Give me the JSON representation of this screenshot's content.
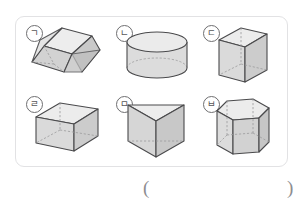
{
  "worksheet": {
    "answer_blank": {
      "open_paren": "(",
      "close_paren": ")"
    },
    "border_color": "#e2e2e4",
    "solid_fill_color": "#d9d9d9",
    "solid_stroke_color": "#4a4a4c",
    "hidden_edge_color": "#9a9a9c"
  },
  "solids": [
    {
      "label": "ㄱ",
      "name": "trapezoidal-prism",
      "shape_type": "trapezoidal prism",
      "row": 0,
      "column": 0
    },
    {
      "label": "ㄴ",
      "name": "cylinder",
      "shape_type": "cylinder",
      "row": 0,
      "column": 1
    },
    {
      "label": "ㄷ",
      "name": "rectangular-prism-tall",
      "shape_type": "rectangular prism",
      "row": 0,
      "column": 2
    },
    {
      "label": "ㄹ",
      "name": "rectangular-prism-wide",
      "shape_type": "rectangular prism",
      "row": 1,
      "column": 0
    },
    {
      "label": "ㅁ",
      "name": "triangular-prism",
      "shape_type": "triangular prism",
      "row": 1,
      "column": 1
    },
    {
      "label": "ㅂ",
      "name": "hexagonal-prism",
      "shape_type": "hexagonal prism",
      "row": 1,
      "column": 2
    }
  ]
}
